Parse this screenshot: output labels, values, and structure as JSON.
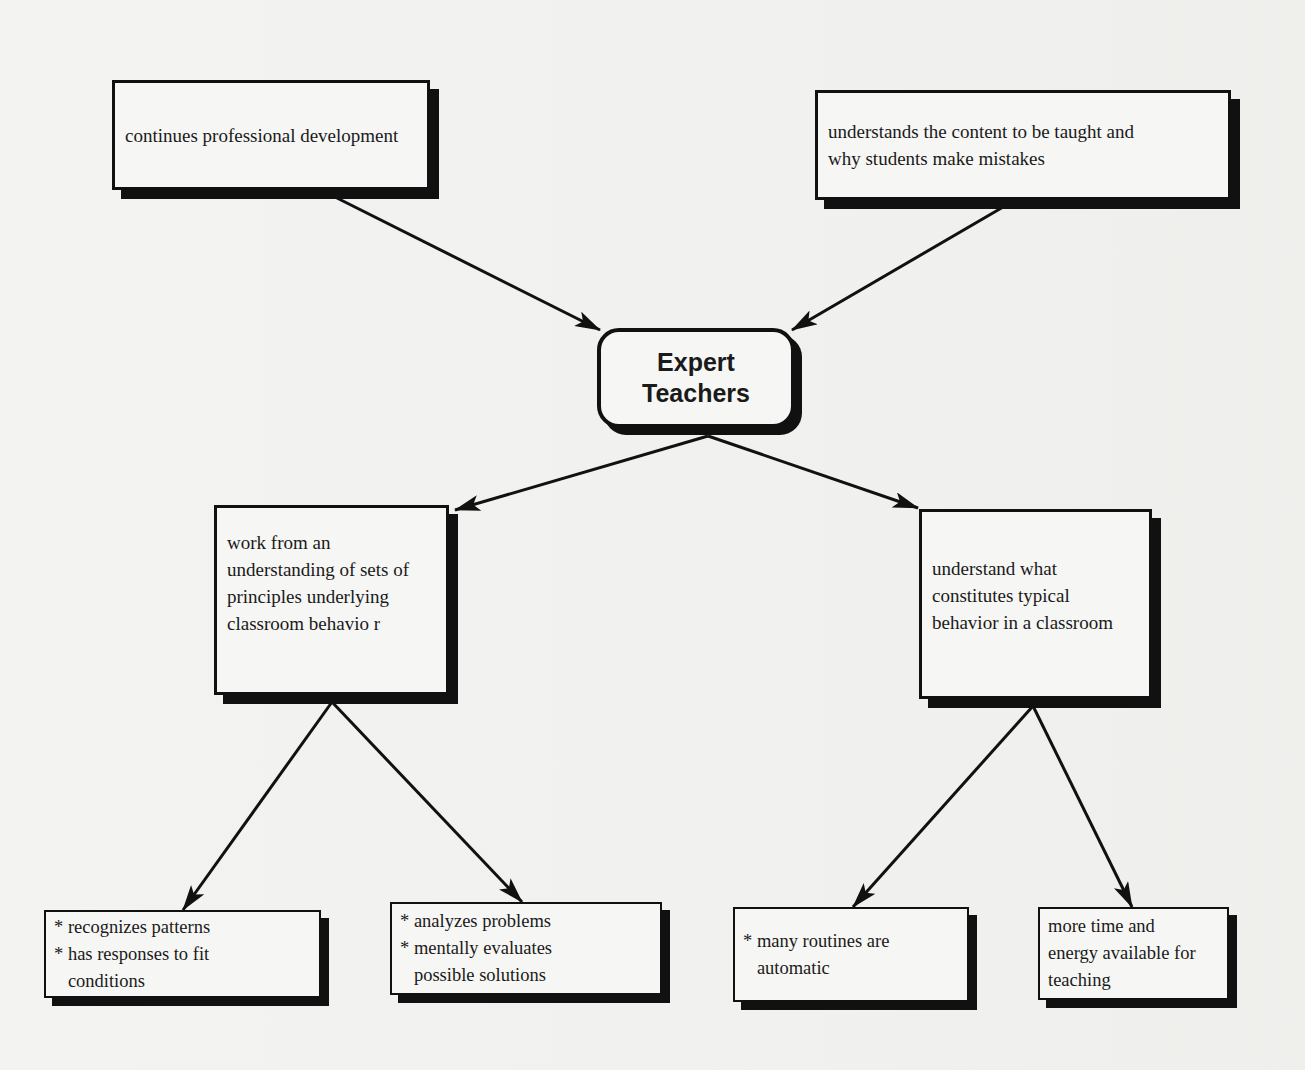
{
  "diagram": {
    "type": "concept-map",
    "central": {
      "label": "Expert\nTeachers"
    },
    "inputs": [
      {
        "id": "prof-dev",
        "label": "continues professional development"
      },
      {
        "id": "content",
        "label": "understands the content to be taught and\nwhy students make mistakes"
      }
    ],
    "branches": [
      {
        "id": "principles",
        "label": "work from an\nunderstanding of sets of\nprinciples underlying\nclassroom behavio  r",
        "children": [
          {
            "id": "patterns",
            "bullets": [
              "* recognizes patterns",
              "* has responses to fit conditions"
            ],
            "lines": [
              "* recognizes patterns",
              "* has responses to fit",
              "   conditions"
            ]
          },
          {
            "id": "problems",
            "lines": [
              "* analyzes problems",
              "* mentally evaluates",
              "   possible solutions"
            ]
          }
        ]
      },
      {
        "id": "typical",
        "label": "understand what\nconstitutes typical\nbehavior in a classroom",
        "children": [
          {
            "id": "routines",
            "lines": [
              "* many routines are",
              "   automatic"
            ]
          },
          {
            "id": "time",
            "lines": [
              "more time and",
              "energy available for",
              "teaching"
            ]
          }
        ]
      }
    ],
    "edges": [
      {
        "from": "prof-dev",
        "to": "central"
      },
      {
        "from": "content",
        "to": "central"
      },
      {
        "from": "central",
        "to": "principles"
      },
      {
        "from": "central",
        "to": "typical"
      },
      {
        "from": "principles",
        "to": "patterns"
      },
      {
        "from": "principles",
        "to": "problems"
      },
      {
        "from": "typical",
        "to": "routines"
      },
      {
        "from": "typical",
        "to": "time"
      }
    ]
  },
  "colors": {
    "ink": "#111111",
    "paper": "#f3f3f1"
  }
}
